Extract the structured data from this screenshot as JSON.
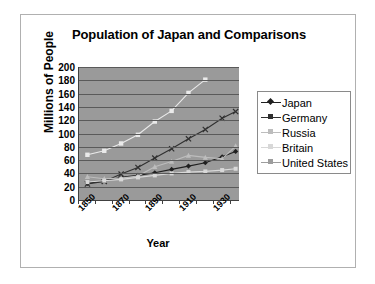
{
  "chart": {
    "type": "line",
    "title": "Population of Japan and Comparisons",
    "xlabel": "Year",
    "ylabel": "Millions of People"
  },
  "chart_data": {
    "type": "line",
    "title": "Population of Japan and Comparisons",
    "xlabel": "Year",
    "ylabel": "Millions of People",
    "xlim": [
      1850,
      1945
    ],
    "ylim": [
      0,
      200
    ],
    "ytick_step": 20,
    "yticks": [
      200,
      180,
      160,
      140,
      120,
      100,
      80,
      60,
      40,
      20,
      0
    ],
    "xticks": [
      1850,
      1870,
      1890,
      1910,
      1930
    ],
    "grid": "horizontal",
    "legend_position": "right",
    "series": [
      {
        "name": "Japan",
        "color": "#202020",
        "marker": "diamond",
        "x": [
          1855,
          1865,
          1875,
          1885,
          1895,
          1905,
          1915,
          1925,
          1935,
          1943
        ],
        "values": [
          25,
          29,
          34,
          37,
          41,
          46,
          51,
          56,
          65,
          73
        ]
      },
      {
        "name": "Germany",
        "color": "#303030",
        "marker": "cross",
        "x": [
          1855,
          1865,
          1875,
          1885,
          1895,
          1905,
          1915,
          1925,
          1935,
          1943
        ],
        "values": [
          24,
          28,
          39,
          49,
          63,
          77,
          92,
          106,
          123,
          133
        ]
      },
      {
        "name": "Russia",
        "color": "#bdbdbd",
        "marker": "triangle",
        "x": [
          1855,
          1865,
          1875,
          1885,
          1895,
          1905,
          1915,
          1925,
          1935,
          1943
        ],
        "values": [
          35,
          32,
          33,
          36,
          50,
          58,
          67,
          64,
          62,
          81
        ]
      },
      {
        "name": "Britain",
        "color": "#d8d8d8",
        "marker": "square",
        "x": [
          1855,
          1865,
          1875,
          1885,
          1895,
          1905,
          1915,
          1925,
          1935,
          1943
        ],
        "values": [
          27,
          29,
          31,
          34,
          37,
          40,
          42,
          43,
          45,
          47
        ]
      },
      {
        "name": "United States",
        "color": "#eaeaea",
        "marker": "star",
        "x": [
          1855,
          1865,
          1875,
          1885,
          1895,
          1905,
          1915,
          1925
        ],
        "values": [
          68,
          74,
          85,
          98,
          118,
          134,
          161,
          181
        ]
      }
    ]
  },
  "legend": {
    "items": [
      {
        "label": "Japan",
        "color": "#202020"
      },
      {
        "label": "Germany",
        "color": "#303030"
      },
      {
        "label": "Russia",
        "color": "#bdbdbd"
      },
      {
        "label": "Britain",
        "color": "#d8d8d8"
      },
      {
        "label": "United States",
        "color": "#9d9d9d"
      }
    ]
  }
}
